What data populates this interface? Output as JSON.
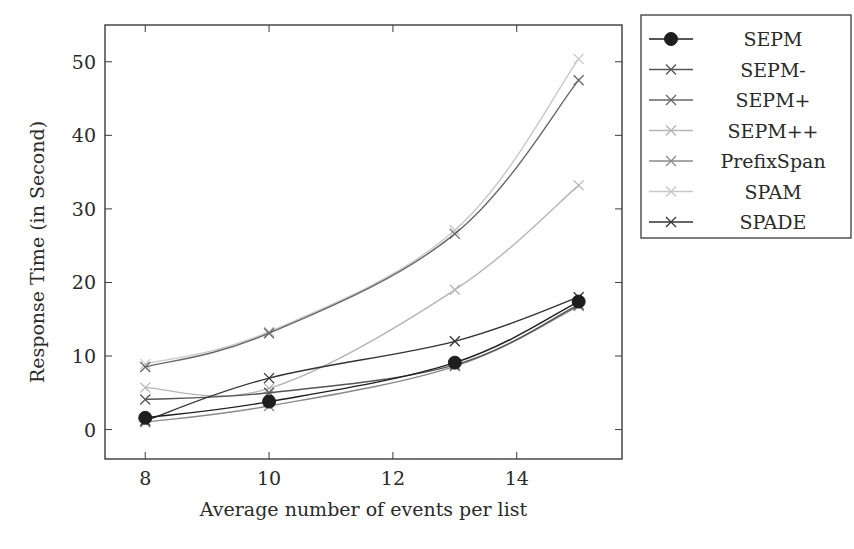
{
  "chart_data": {
    "type": "line",
    "title": "",
    "xlabel": "Average number of events per list",
    "ylabel": "Response Time (in Second)",
    "x": [
      8,
      10,
      13,
      15
    ],
    "xticks": [
      8,
      10,
      12,
      14
    ],
    "yticks": [
      0,
      10,
      20,
      30,
      40,
      50
    ],
    "xlim": [
      7.35,
      15.7
    ],
    "ylim": [
      -4,
      55
    ],
    "grid": false,
    "legend_position": "outside-right-top",
    "series": [
      {
        "name": "SEPM",
        "values": [
          1.6,
          3.8,
          9.1,
          17.4
        ],
        "color": "#1e1e1e",
        "marker": "circle"
      },
      {
        "name": "SEPM-",
        "values": [
          4.1,
          5.0,
          8.8,
          17.0
        ],
        "color": "#555555",
        "marker": "x"
      },
      {
        "name": "SEPM+",
        "values": [
          8.5,
          13.1,
          26.6,
          47.5
        ],
        "color": "#666666",
        "marker": "x"
      },
      {
        "name": "SEPM++",
        "values": [
          5.7,
          5.6,
          19.0,
          33.2
        ],
        "color": "#b5b5b5",
        "marker": "x"
      },
      {
        "name": "PrefixSpan",
        "values": [
          1.0,
          3.2,
          8.6,
          16.8
        ],
        "color": "#8a8a8a",
        "marker": "x"
      },
      {
        "name": "SPAM",
        "values": [
          8.9,
          13.3,
          27.1,
          50.4
        ],
        "color": "#c8c8c8",
        "marker": "x"
      },
      {
        "name": "SPADE",
        "values": [
          1.2,
          7.0,
          12.0,
          18.0
        ],
        "color": "#333333",
        "marker": "x"
      }
    ]
  },
  "layout": {
    "plot": {
      "left": 105,
      "right": 622,
      "top": 25,
      "bottom": 459
    },
    "legend": {
      "left": 641,
      "top": 15,
      "width": 210,
      "height": 223
    }
  }
}
